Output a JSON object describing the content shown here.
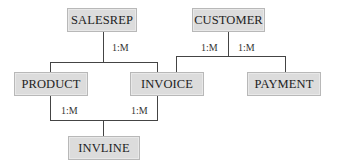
{
  "diagram": {
    "type": "entity-relationship",
    "entities": [
      {
        "id": "salesrep",
        "label": "SALESREP"
      },
      {
        "id": "customer",
        "label": "CUSTOMER"
      },
      {
        "id": "product",
        "label": "PRODUCT"
      },
      {
        "id": "invoice",
        "label": "INVOICE"
      },
      {
        "id": "payment",
        "label": "PAYMENT"
      },
      {
        "id": "invline",
        "label": "INVLINE"
      }
    ],
    "relationships": [
      {
        "from": "salesrep",
        "to": "invoice",
        "cardinality": "1:M"
      },
      {
        "from": "customer",
        "to": "invoice",
        "cardinality": "1:M"
      },
      {
        "from": "customer",
        "to": "payment",
        "cardinality": "1:M"
      },
      {
        "from": "product",
        "to": "invline",
        "cardinality": "1:M"
      },
      {
        "from": "invoice",
        "to": "invline",
        "cardinality": "1:M"
      }
    ]
  },
  "colors": {
    "entity_fill": "#dcdcdc",
    "entity_border": "#b8b8b8",
    "line": "#444444"
  }
}
